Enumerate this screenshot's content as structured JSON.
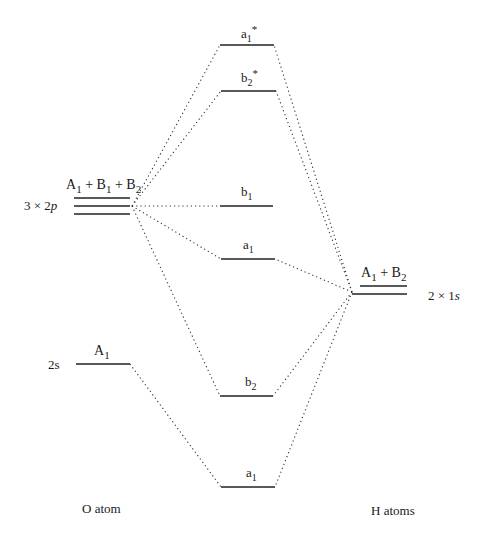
{
  "diagram": {
    "type": "molecular-orbital-energy-level-diagram",
    "left_column": {
      "title": "O atom",
      "levels": [
        {
          "name": "2p",
          "label_left": "3 × 2p",
          "symmetry": "A1 + B1 + B2",
          "lines": 3
        },
        {
          "name": "2s",
          "label_left": "2s",
          "symmetry": "A1",
          "lines": 1
        }
      ]
    },
    "right_column": {
      "title": "H atoms",
      "levels": [
        {
          "name": "1s",
          "label_right": "2 × 1s",
          "symmetry": "A1 + B2",
          "lines": 2
        }
      ]
    },
    "molecular_orbitals": [
      {
        "label": "a1*",
        "base": "a",
        "sub": "1",
        "sup": "*"
      },
      {
        "label": "b2*",
        "base": "b",
        "sub": "2",
        "sup": "*"
      },
      {
        "label": "b1",
        "base": "b",
        "sub": "1",
        "sup": ""
      },
      {
        "label": "a1",
        "base": "a",
        "sub": "1",
        "sup": ""
      },
      {
        "label": "b2",
        "base": "b",
        "sub": "2",
        "sup": ""
      },
      {
        "label": "a1",
        "base": "a",
        "sub": "1",
        "sup": ""
      }
    ]
  },
  "text": {
    "o_2p_sym": {
      "A": "A",
      "A_sub": "1",
      "plus1": " + ",
      "B1": "B",
      "B1_sub": "1",
      "plus2": " + ",
      "B2": "B",
      "B2_sub": "2"
    },
    "o_2p_left": {
      "prefix": "3 × 2",
      "ital": "p"
    },
    "o_2s_sym": {
      "A": "A",
      "A_sub": "1"
    },
    "o_2s_left": "2s",
    "h_sym": {
      "A": "A",
      "A_sub": "1",
      "plus": " + ",
      "B": "B",
      "B_sub": "2"
    },
    "h_right": {
      "prefix": "2 × 1",
      "ital": "s"
    },
    "o_title": "O atom",
    "h_title": "H atoms"
  }
}
